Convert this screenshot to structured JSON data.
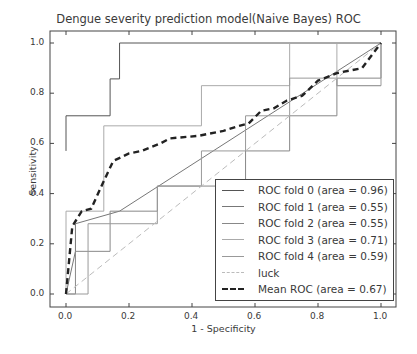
{
  "chart_data": {
    "type": "line",
    "title": "Dengue severity prediction model(Naive Bayes) ROC",
    "xlabel": "1 - Specificity",
    "ylabel": "Sensitivity",
    "xlim": [
      -0.05,
      1.05
    ],
    "ylim": [
      -0.05,
      1.05
    ],
    "xticks": [
      "0.0",
      "0.2",
      "0.4",
      "0.6",
      "0.8",
      "1.0"
    ],
    "yticks": [
      "0.0",
      "0.2",
      "0.4",
      "0.6",
      "0.8",
      "1.0"
    ],
    "grid": false,
    "legend_position": "lower right",
    "series": [
      {
        "name": "ROC fold 0 (area = 0.96)",
        "color": "#555555",
        "style": "solid",
        "x": [
          0,
          0,
          0.14,
          0.14,
          0.17,
          0.17,
          1.0
        ],
        "y": [
          0.57,
          0.71,
          0.71,
          0.857,
          0.857,
          1.0,
          1.0
        ]
      },
      {
        "name": "ROC fold 1 (area = 0.55)",
        "color": "#777777",
        "style": "solid",
        "x": [
          0,
          0.03,
          0.03,
          0.17,
          1.0
        ],
        "y": [
          0,
          0.17,
          0.28,
          0.33,
          1.0
        ]
      },
      {
        "name": "ROC fold 2 (area = 0.55)",
        "color": "#888888",
        "style": "solid",
        "x": [
          0,
          0.03,
          0.03,
          0.14,
          0.14,
          0.29,
          0.29,
          0.57,
          0.57,
          0.71,
          0.71,
          0.86,
          0.86,
          1.0,
          1.0
        ],
        "y": [
          0,
          0,
          0.17,
          0.17,
          0.33,
          0.33,
          0.43,
          0.43,
          0.57,
          0.57,
          0.71,
          0.71,
          0.86,
          0.86,
          1.0
        ]
      },
      {
        "name": "ROC fold 3 (area = 0.71)",
        "color": "#aaaaaa",
        "style": "solid",
        "x": [
          0,
          0,
          0.12,
          0.12,
          0.43,
          0.43,
          0.71,
          0.71,
          0.86,
          0.86,
          1.0
        ],
        "y": [
          0,
          0.33,
          0.33,
          0.67,
          0.67,
          0.83,
          0.83,
          1.0,
          1.0,
          0.83,
          0.83
        ]
      },
      {
        "name": "ROC fold 4 (area = 0.59)",
        "color": "#999999",
        "style": "solid",
        "x": [
          0,
          0.07,
          0.07,
          0.29,
          0.29,
          0.43,
          0.43,
          0.57,
          0.57,
          0.71,
          0.71,
          0.86,
          0.86,
          1.0,
          1.0
        ],
        "y": [
          0,
          0,
          0.28,
          0.28,
          0.43,
          0.43,
          0.57,
          0.57,
          0.71,
          0.71,
          0.86,
          0.86,
          0.83,
          0.83,
          1.0
        ]
      },
      {
        "name": "luck",
        "color": "#bbbbbb",
        "style": "dashed",
        "x": [
          0,
          1
        ],
        "y": [
          0,
          1
        ]
      },
      {
        "name": "Mean ROC (area = 0.67)",
        "color": "#222222",
        "style": "dashed-bold",
        "x": [
          0,
          0.02,
          0.05,
          0.08,
          0.12,
          0.15,
          0.2,
          0.24,
          0.3,
          0.33,
          0.42,
          0.5,
          0.55,
          0.58,
          0.62,
          0.66,
          0.7,
          0.75,
          0.8,
          0.86,
          0.94,
          1.0
        ],
        "y": [
          0,
          0.27,
          0.33,
          0.34,
          0.45,
          0.53,
          0.56,
          0.57,
          0.6,
          0.62,
          0.63,
          0.65,
          0.67,
          0.68,
          0.73,
          0.74,
          0.77,
          0.79,
          0.85,
          0.88,
          0.9,
          1.0
        ]
      }
    ]
  }
}
